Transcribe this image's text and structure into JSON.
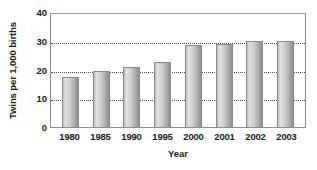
{
  "chart_data": {
    "type": "bar",
    "title": "",
    "categories": [
      "1980",
      "1985",
      "1990",
      "1995",
      "2000",
      "2001",
      "2002",
      "2003"
    ],
    "values": [
      17.5,
      19.5,
      21,
      22.5,
      28.5,
      29,
      30,
      30
    ],
    "series": [
      {
        "name": "Twins per 1,000 births",
        "values": [
          17.5,
          19.5,
          21,
          22.5,
          28.5,
          29,
          30,
          30
        ]
      }
    ],
    "xlabel": "Year",
    "ylabel": "Twins per 1,000 births",
    "ylim": [
      0,
      40
    ],
    "yticks": [
      0,
      10,
      20,
      30,
      40
    ],
    "ytick_labels": [
      "0",
      "10",
      "20",
      "30",
      "40"
    ],
    "gridlines": [
      10,
      20,
      30
    ],
    "grid": true,
    "grid_style": "dotted-horizontal",
    "legend": null,
    "legend_position": "none",
    "bar_color": "#c4c4c4",
    "bar_edge_color": "#8a8a8a",
    "frame_color": "#8c8c8c",
    "text_color": "#1a1a1a",
    "background": "#ffffff"
  }
}
